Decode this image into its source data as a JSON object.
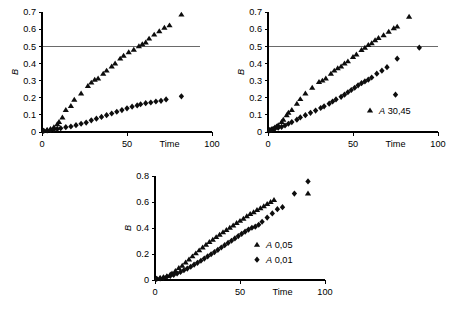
{
  "figure": {
    "background_color": "#ffffff",
    "marker_color": "#0d0d0d",
    "axis_color": "#000000",
    "reference_line_color": "#6a6a6a"
  },
  "chart_data": [
    {
      "id": "panel-a",
      "type": "scatter",
      "title": "",
      "xlabel": "Time",
      "ylabel": "B",
      "xlim": [
        0,
        100
      ],
      "ylim": [
        0,
        0.7
      ],
      "xticks": [
        0,
        50,
        100
      ],
      "xtick_labels": [
        "0",
        "50",
        "100"
      ],
      "yticks": [
        0,
        0.1,
        0.2,
        0.3,
        0.4,
        0.5,
        0.6,
        0.7
      ],
      "ytick_labels": [
        "0",
        "0.1",
        "0.2",
        "0.3",
        "0.4",
        "0.5",
        "0.6",
        "0.7"
      ],
      "grid": false,
      "legend": [],
      "legend_position": "none",
      "reference_lines": [
        {
          "axis": "y",
          "value": 0.5,
          "x_start": 0,
          "x_end": 93
        }
      ],
      "series": [
        {
          "name": "triangles",
          "marker": "triangle",
          "points": [
            [
              1,
              0.008
            ],
            [
              3,
              0.012
            ],
            [
              5,
              0.018
            ],
            [
              7,
              0.028
            ],
            [
              9,
              0.045
            ],
            [
              10,
              0.058
            ],
            [
              12,
              0.085
            ],
            [
              14,
              0.128
            ],
            [
              17,
              0.152
            ],
            [
              19,
              0.188
            ],
            [
              23,
              0.225
            ],
            [
              27,
              0.268
            ],
            [
              29,
              0.288
            ],
            [
              31,
              0.305
            ],
            [
              33,
              0.312
            ],
            [
              36,
              0.34
            ],
            [
              38,
              0.358
            ],
            [
              41,
              0.382
            ],
            [
              43,
              0.4
            ],
            [
              46,
              0.428
            ],
            [
              48,
              0.445
            ],
            [
              51,
              0.465
            ],
            [
              54,
              0.48
            ],
            [
              57,
              0.5
            ],
            [
              59,
              0.512
            ],
            [
              61,
              0.522
            ],
            [
              63,
              0.545
            ],
            [
              66,
              0.568
            ],
            [
              69,
              0.588
            ],
            [
              72,
              0.608
            ],
            [
              75,
              0.622
            ],
            [
              82,
              0.685
            ]
          ]
        },
        {
          "name": "diamonds",
          "marker": "diamond",
          "points": [
            [
              1,
              0.006
            ],
            [
              3,
              0.009
            ],
            [
              5,
              0.012
            ],
            [
              7,
              0.015
            ],
            [
              9,
              0.018
            ],
            [
              11,
              0.022
            ],
            [
              14,
              0.028
            ],
            [
              17,
              0.032
            ],
            [
              20,
              0.04
            ],
            [
              23,
              0.048
            ],
            [
              26,
              0.055
            ],
            [
              29,
              0.068
            ],
            [
              32,
              0.078
            ],
            [
              35,
              0.088
            ],
            [
              38,
              0.098
            ],
            [
              41,
              0.108
            ],
            [
              44,
              0.118
            ],
            [
              47,
              0.128
            ],
            [
              50,
              0.138
            ],
            [
              53,
              0.148
            ],
            [
              56,
              0.155
            ],
            [
              58,
              0.162
            ],
            [
              61,
              0.168
            ],
            [
              64,
              0.172
            ],
            [
              67,
              0.178
            ],
            [
              70,
              0.182
            ],
            [
              73,
              0.19
            ],
            [
              82,
              0.208
            ]
          ]
        }
      ]
    },
    {
      "id": "panel-b",
      "type": "scatter",
      "title": "",
      "xlabel": "Time",
      "ylabel": "B",
      "xlim": [
        0,
        100
      ],
      "ylim": [
        0,
        0.7
      ],
      "xticks": [
        0,
        50,
        100
      ],
      "xtick_labels": [
        "0",
        "50",
        "100"
      ],
      "yticks": [
        0,
        0.1,
        0.2,
        0.3,
        0.4,
        0.5,
        0.6,
        0.7
      ],
      "ytick_labels": [
        "0",
        "0.1",
        "0.2",
        "0.3",
        "0.4",
        "0.5",
        "0.6",
        "0.7"
      ],
      "grid": false,
      "legend": [
        {
          "marker": "triangle",
          "label": "A 30,45"
        }
      ],
      "legend_position": "lower-right",
      "reference_lines": [
        {
          "axis": "y",
          "value": 0.5,
          "x_start": 0,
          "x_end": 100
        }
      ],
      "series": [
        {
          "name": "triangles",
          "marker": "triangle",
          "points": [
            [
              1,
              0.012
            ],
            [
              2,
              0.016
            ],
            [
              3,
              0.02
            ],
            [
              4,
              0.026
            ],
            [
              5,
              0.032
            ],
            [
              6,
              0.04
            ],
            [
              8,
              0.058
            ],
            [
              9,
              0.072
            ],
            [
              11,
              0.098
            ],
            [
              12,
              0.112
            ],
            [
              14,
              0.128
            ],
            [
              17,
              0.165
            ],
            [
              19,
              0.192
            ],
            [
              22,
              0.225
            ],
            [
              26,
              0.258
            ],
            [
              30,
              0.292
            ],
            [
              32,
              0.3
            ],
            [
              34,
              0.312
            ],
            [
              37,
              0.34
            ],
            [
              39,
              0.358
            ],
            [
              41,
              0.372
            ],
            [
              43,
              0.382
            ],
            [
              45,
              0.4
            ],
            [
              47,
              0.412
            ],
            [
              50,
              0.438
            ],
            [
              52,
              0.452
            ],
            [
              55,
              0.478
            ],
            [
              57,
              0.492
            ],
            [
              59,
              0.508
            ],
            [
              61,
              0.518
            ],
            [
              63,
              0.535
            ],
            [
              65,
              0.548
            ],
            [
              68,
              0.565
            ],
            [
              71,
              0.585
            ],
            [
              74,
              0.605
            ],
            [
              76,
              0.615
            ],
            [
              83,
              0.672
            ]
          ]
        },
        {
          "name": "diamonds",
          "marker": "diamond",
          "points": [
            [
              1,
              0.01
            ],
            [
              2,
              0.013
            ],
            [
              3,
              0.016
            ],
            [
              4,
              0.02
            ],
            [
              6,
              0.025
            ],
            [
              8,
              0.03
            ],
            [
              10,
              0.038
            ],
            [
              12,
              0.048
            ],
            [
              14,
              0.058
            ],
            [
              17,
              0.072
            ],
            [
              19,
              0.085
            ],
            [
              22,
              0.098
            ],
            [
              25,
              0.112
            ],
            [
              28,
              0.125
            ],
            [
              31,
              0.14
            ],
            [
              33,
              0.15
            ],
            [
              36,
              0.165
            ],
            [
              38,
              0.178
            ],
            [
              40,
              0.19
            ],
            [
              43,
              0.205
            ],
            [
              45,
              0.218
            ],
            [
              47,
              0.232
            ],
            [
              49,
              0.245
            ],
            [
              51,
              0.258
            ],
            [
              53,
              0.272
            ],
            [
              55,
              0.285
            ],
            [
              57,
              0.295
            ],
            [
              59,
              0.305
            ],
            [
              61,
              0.318
            ],
            [
              64,
              0.34
            ],
            [
              67,
              0.358
            ],
            [
              70,
              0.378
            ],
            [
              76,
              0.428
            ],
            [
              75,
              0.218
            ],
            [
              89,
              0.492
            ]
          ]
        }
      ]
    },
    {
      "id": "panel-c",
      "type": "scatter",
      "title": "",
      "xlabel": "Time",
      "ylabel": "B",
      "xlim": [
        0,
        100
      ],
      "ylim": [
        0,
        0.8
      ],
      "xticks": [
        0,
        50,
        100
      ],
      "xtick_labels": [
        "0",
        "50",
        "100"
      ],
      "yticks": [
        0,
        0.2,
        0.4,
        0.6,
        0.8
      ],
      "ytick_labels": [
        "0",
        "0.2",
        "0.4",
        "0.6",
        "0.8"
      ],
      "grid": false,
      "legend": [
        {
          "marker": "triangle",
          "label": "A 0,05"
        },
        {
          "marker": "diamond",
          "label": "A 0,01"
        }
      ],
      "legend_position": "lower-right",
      "reference_lines": [],
      "series": [
        {
          "name": "triangles",
          "marker": "triangle",
          "points": [
            [
              1,
              0.01
            ],
            [
              3,
              0.016
            ],
            [
              5,
              0.022
            ],
            [
              7,
              0.03
            ],
            [
              9,
              0.042
            ],
            [
              10,
              0.05
            ],
            [
              12,
              0.07
            ],
            [
              14,
              0.092
            ],
            [
              16,
              0.11
            ],
            [
              18,
              0.135
            ],
            [
              20,
              0.158
            ],
            [
              22,
              0.182
            ],
            [
              24,
              0.205
            ],
            [
              26,
              0.228
            ],
            [
              28,
              0.25
            ],
            [
              30,
              0.272
            ],
            [
              32,
              0.292
            ],
            [
              34,
              0.31
            ],
            [
              36,
              0.33
            ],
            [
              38,
              0.348
            ],
            [
              40,
              0.368
            ],
            [
              42,
              0.385
            ],
            [
              44,
              0.402
            ],
            [
              46,
              0.42
            ],
            [
              48,
              0.438
            ],
            [
              50,
              0.455
            ],
            [
              52,
              0.472
            ],
            [
              54,
              0.49
            ],
            [
              56,
              0.508
            ],
            [
              58,
              0.522
            ],
            [
              60,
              0.538
            ],
            [
              62,
              0.552
            ],
            [
              64,
              0.568
            ],
            [
              66,
              0.585
            ],
            [
              68,
              0.6
            ],
            [
              70,
              0.615
            ],
            [
              90,
              0.665
            ]
          ]
        },
        {
          "name": "diamonds",
          "marker": "diamond",
          "points": [
            [
              1,
              0.008
            ],
            [
              3,
              0.012
            ],
            [
              5,
              0.018
            ],
            [
              7,
              0.025
            ],
            [
              9,
              0.032
            ],
            [
              11,
              0.04
            ],
            [
              13,
              0.05
            ],
            [
              15,
              0.062
            ],
            [
              17,
              0.075
            ],
            [
              19,
              0.088
            ],
            [
              21,
              0.102
            ],
            [
              23,
              0.118
            ],
            [
              25,
              0.132
            ],
            [
              27,
              0.148
            ],
            [
              29,
              0.165
            ],
            [
              31,
              0.182
            ],
            [
              33,
              0.198
            ],
            [
              35,
              0.215
            ],
            [
              37,
              0.232
            ],
            [
              39,
              0.25
            ],
            [
              41,
              0.268
            ],
            [
              43,
              0.285
            ],
            [
              45,
              0.302
            ],
            [
              47,
              0.32
            ],
            [
              49,
              0.338
            ],
            [
              51,
              0.355
            ],
            [
              53,
              0.372
            ],
            [
              55,
              0.388
            ],
            [
              57,
              0.402
            ],
            [
              59,
              0.41
            ],
            [
              61,
              0.425
            ],
            [
              63,
              0.448
            ],
            [
              66,
              0.48
            ],
            [
              69,
              0.512
            ],
            [
              72,
              0.545
            ],
            [
              75,
              0.56
            ],
            [
              82,
              0.665
            ],
            [
              90,
              0.758
            ]
          ]
        }
      ]
    }
  ]
}
